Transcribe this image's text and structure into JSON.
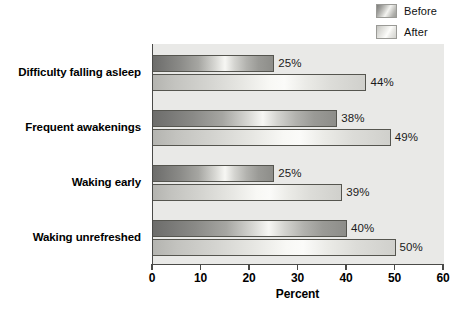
{
  "chart_data": {
    "type": "bar",
    "orientation": "horizontal",
    "title": "",
    "xlabel": "Percent",
    "ylabel": "",
    "xlim": [
      0,
      60
    ],
    "xticks": [
      0,
      10,
      20,
      30,
      40,
      50,
      60
    ],
    "grid": false,
    "legend_position": "top-right",
    "categories": [
      "Difficulty falling asleep",
      "Frequent awakenings",
      "Waking early",
      "Waking unrefreshed"
    ],
    "series": [
      {
        "name": "Before",
        "color": "#8a8a87",
        "values": [
          25,
          38,
          25,
          40
        ],
        "labels": [
          "25%",
          "38%",
          "25%",
          "40%"
        ]
      },
      {
        "name": "After",
        "color": "#d4d4d0",
        "values": [
          44,
          49,
          39,
          50
        ],
        "labels": [
          "44%",
          "49%",
          "39%",
          "50%"
        ]
      }
    ]
  },
  "legend": {
    "items": [
      {
        "label": "Before",
        "swatch": "before-swatch"
      },
      {
        "label": "After",
        "swatch": "after-swatch"
      }
    ]
  },
  "axis": {
    "x_title": "Percent",
    "tick_labels": [
      "0",
      "10",
      "20",
      "30",
      "40",
      "50",
      "60"
    ]
  },
  "colors": {
    "plot_background": "#e9e9e7",
    "axis_line": "#4a4a48",
    "bar_outline": "#55554f",
    "text": "#000000",
    "page_background": "#ffffff"
  }
}
